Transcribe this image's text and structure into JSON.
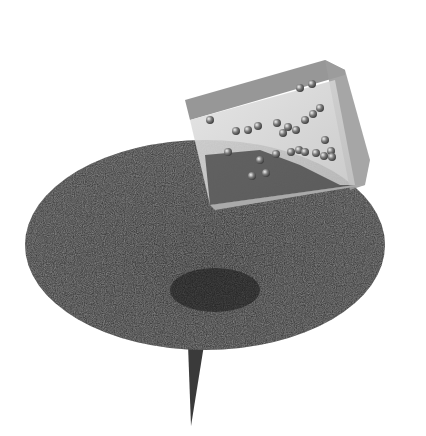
{
  "scene": {
    "description": "Grayscale 3D render: dark textured disc on a thin tapering stalk, with a translucent tilted cube containing small spheres resting over its upper-right edge",
    "colors": {
      "background": "#ffffff",
      "disc": "#2e2e2e",
      "disc_shadow": "#1c1c1c",
      "stalk": "#3a3a3a",
      "cube_face_top": "#8a8a8a",
      "cube_face_front": "#d4d4d4",
      "cube_face_side": "#9a9a9a",
      "sphere": "#6a6a6a"
    },
    "spheres": [
      [
        210,
        120
      ],
      [
        236,
        131
      ],
      [
        248,
        130
      ],
      [
        258,
        126
      ],
      [
        277,
        123
      ],
      [
        283,
        133
      ],
      [
        288,
        127
      ],
      [
        296,
        130
      ],
      [
        305,
        120
      ],
      [
        313,
        114
      ],
      [
        320,
        108
      ],
      [
        325,
        140
      ],
      [
        331,
        151
      ],
      [
        291,
        152
      ],
      [
        299,
        150
      ],
      [
        305,
        152
      ],
      [
        316,
        153
      ],
      [
        324,
        156
      ],
      [
        332,
        157
      ],
      [
        260,
        160
      ],
      [
        276,
        154
      ],
      [
        252,
        176
      ],
      [
        266,
        173
      ],
      [
        300,
        88
      ],
      [
        312,
        84
      ],
      [
        228,
        152
      ]
    ]
  }
}
